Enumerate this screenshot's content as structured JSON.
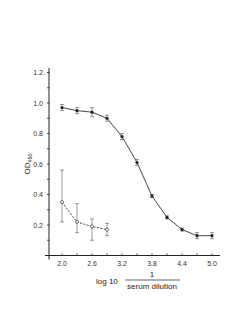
{
  "chart_data": {
    "type": "line",
    "title": "",
    "xlabel_prefix": "log 10",
    "xlabel_numerator": "1",
    "xlabel_denominator": "serum dilution",
    "ylabel_main": "OD",
    "ylabel_sub": "450",
    "xlim": [
      1.85,
      5.15
    ],
    "ylim": [
      0,
      1.2
    ],
    "xticks": [
      2.0,
      2.3,
      2.6,
      2.9,
      3.2,
      3.5,
      3.8,
      4.1,
      4.4,
      4.7,
      5.0
    ],
    "xtick_labels": [
      "2.0",
      "2.6",
      "3.2",
      "3.8",
      "4.4",
      "5.0"
    ],
    "xtick_label_values": [
      2.0,
      2.6,
      3.2,
      3.8,
      4.4,
      5.0
    ],
    "yticks": [
      0.1,
      0.2,
      0.3,
      0.4,
      0.5,
      0.6,
      0.7,
      0.8,
      0.9,
      1.0,
      1.1,
      1.2
    ],
    "ytick_labels": [
      "0.2",
      "0.4",
      "0.6",
      "0.8",
      "1.0",
      "1.2"
    ],
    "ytick_label_values": [
      0.2,
      0.4,
      0.6,
      0.8,
      1.0,
      1.2
    ],
    "grid": false,
    "series": [
      {
        "name": "immune serum",
        "marker": "filled-circle",
        "line": "solid",
        "x": [
          2.0,
          2.3,
          2.6,
          2.9,
          3.2,
          3.5,
          3.8,
          4.1,
          4.4,
          4.7,
          5.0
        ],
        "y": [
          0.97,
          0.95,
          0.94,
          0.9,
          0.78,
          0.61,
          0.39,
          0.25,
          0.17,
          0.13,
          0.13
        ],
        "err": [
          0.02,
          0.02,
          0.03,
          0.02,
          0.02,
          0.02,
          0.01,
          0.01,
          0.01,
          0.02,
          0.02
        ]
      },
      {
        "name": "control serum",
        "marker": "open-circle",
        "line": "dashed",
        "x": [
          2.0,
          2.3,
          2.6,
          2.9
        ],
        "y": [
          0.35,
          0.22,
          0.19,
          0.17
        ],
        "err_low": [
          0.22,
          0.15,
          0.1,
          0.13
        ],
        "err_high": [
          0.56,
          0.34,
          0.24,
          0.21
        ]
      }
    ]
  }
}
